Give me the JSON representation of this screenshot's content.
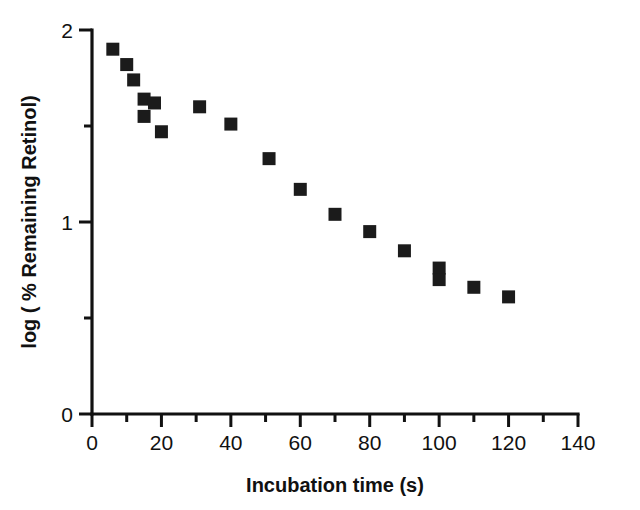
{
  "chart_data": {
    "type": "scatter",
    "title": "",
    "xlabel": "Incubation time (s)",
    "ylabel": "log ( % Remaining Retinol)",
    "xlim": [
      0,
      140
    ],
    "ylim": [
      0,
      2
    ],
    "grid": false,
    "legend": null,
    "x_ticks": [
      0,
      20,
      40,
      60,
      80,
      100,
      120,
      140
    ],
    "x_tick_labels": [
      "0",
      "20",
      "40",
      "60",
      "80",
      "100",
      "120",
      "140"
    ],
    "x_minor_ticks": [
      10,
      30,
      50,
      70,
      90,
      110,
      130
    ],
    "y_ticks": [
      0,
      1,
      2
    ],
    "y_tick_labels": [
      "0",
      "1",
      "2"
    ],
    "y_minor_ticks": [
      0.5,
      1.5
    ],
    "marker": "square",
    "marker_color": "#1b1b1b",
    "series": [
      {
        "name": "Remaining retinol",
        "points": [
          {
            "x": 6,
            "y": 1.9
          },
          {
            "x": 10,
            "y": 1.82
          },
          {
            "x": 12,
            "y": 1.74
          },
          {
            "x": 15,
            "y": 1.64
          },
          {
            "x": 15,
            "y": 1.55
          },
          {
            "x": 18,
            "y": 1.62
          },
          {
            "x": 20,
            "y": 1.47
          },
          {
            "x": 31,
            "y": 1.6
          },
          {
            "x": 40,
            "y": 1.51
          },
          {
            "x": 51,
            "y": 1.33
          },
          {
            "x": 60,
            "y": 1.17
          },
          {
            "x": 70,
            "y": 1.04
          },
          {
            "x": 80,
            "y": 0.95
          },
          {
            "x": 90,
            "y": 0.85
          },
          {
            "x": 100,
            "y": 0.76
          },
          {
            "x": 100,
            "y": 0.7
          },
          {
            "x": 110,
            "y": 0.66
          },
          {
            "x": 120,
            "y": 0.61
          }
        ]
      }
    ]
  }
}
